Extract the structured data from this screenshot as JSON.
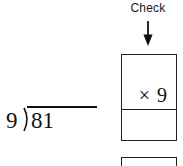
{
  "annotation": {
    "check_label": "Check",
    "arrow_icon": "down-arrow-icon"
  },
  "division_problem": {
    "divisor": "9",
    "dividend": "81",
    "quotient": "",
    "notation": "long-division-bracket"
  },
  "check_work": {
    "boxes": [
      {
        "upper_cell_value": "× 9",
        "lower_cell_value": ""
      },
      {
        "upper_cell_value": "",
        "lower_cell_value": ""
      }
    ]
  },
  "colors": {
    "background": "#ffffff",
    "ink": "#111111",
    "rule": "#222222"
  }
}
